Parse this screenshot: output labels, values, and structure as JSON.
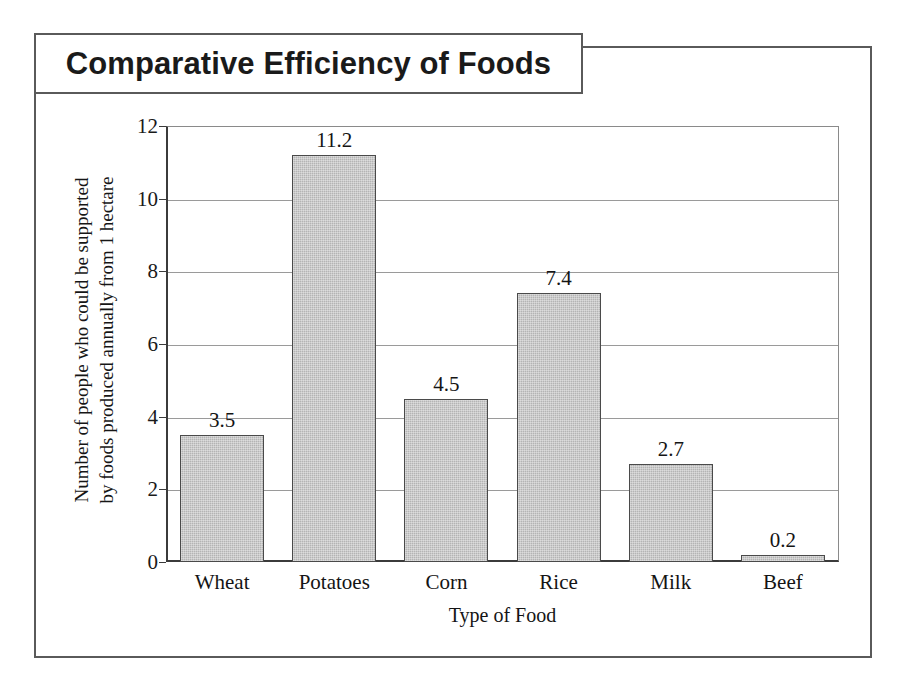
{
  "chart_data": {
    "type": "bar",
    "title": "Comparative Efficiency of Foods",
    "xlabel": "Type of Food",
    "ylabel": "Number of people who could be supported\nby foods produced annually from 1 hectare",
    "categories": [
      "Wheat",
      "Potatoes",
      "Corn",
      "Rice",
      "Milk",
      "Beef"
    ],
    "values": [
      3.5,
      11.2,
      4.5,
      7.4,
      2.7,
      0.2
    ],
    "value_labels": [
      "3.5",
      "11.2",
      "4.5",
      "7.4",
      "2.7",
      "0.2"
    ],
    "ylim": [
      0,
      12
    ],
    "yticks": [
      0,
      2,
      4,
      6,
      8,
      10,
      12
    ],
    "ytick_labels": [
      "0",
      "2",
      "4",
      "6",
      "8",
      "10",
      "12"
    ],
    "grid": true,
    "grid_axis": "y",
    "legend": false,
    "bar_fill_color": "#b4b4b4",
    "bar_border_color": "#4a4a4a",
    "gridline_color": "#9a9a9a",
    "axis_color": "#3b3b3b",
    "background_color": "#ffffff",
    "text_color": "#141414"
  }
}
